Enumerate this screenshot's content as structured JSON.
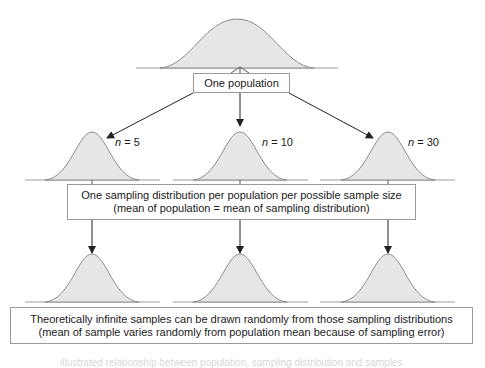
{
  "diagram": {
    "population_box": {
      "label": "One population"
    },
    "sample_sizes": [
      {
        "var": "n",
        "eq": " = ",
        "value": "5"
      },
      {
        "var": "n",
        "eq": " = ",
        "value": "10"
      },
      {
        "var": "n",
        "eq": " = ",
        "value": "30"
      }
    ],
    "sampling_box": {
      "line1": "One sampling distribution per population per possible sample size",
      "line2": "(mean of population = mean of sampling distribution)"
    },
    "samples_box": {
      "line1": "Theoretically infinite samples can be drawn randomly from those sampling distributions",
      "line2": "(mean of sample varies randomly from population mean because of sampling error)"
    },
    "caption": "illustrated relationship between population, sampling distribution and samples",
    "colors": {
      "curve_fill": "#e6e6e6",
      "curve_stroke": "#8c8c8c",
      "arrow": "#222222",
      "box_border": "#9a9a9a"
    }
  }
}
